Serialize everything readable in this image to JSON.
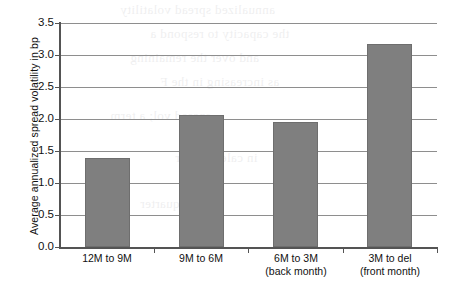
{
  "chart_data": {
    "type": "bar",
    "title": "",
    "xlabel": "",
    "ylabel": "Average annualized spread volatility in bp",
    "categories": [
      "12M to 9M",
      "9M to 6M",
      "6M to 3M\n(back month)",
      "3M to del\n(front month)"
    ],
    "category_lines": [
      [
        "12M to 9M",
        ""
      ],
      [
        "9M to 6M",
        ""
      ],
      [
        "6M to 3M",
        "(back month)"
      ],
      [
        "3M to del",
        "(front month)"
      ]
    ],
    "values": [
      1.39,
      2.06,
      1.96,
      3.17
    ],
    "ylim": [
      0.0,
      3.5
    ],
    "ytick_labels": [
      "3.5",
      "3.0",
      "2.5",
      "2.0",
      "1.5",
      "1.0",
      "0.5",
      "0.0"
    ],
    "ytick_values": [
      3.5,
      3.0,
      2.5,
      2.0,
      1.5,
      1.0,
      0.5,
      0.0
    ],
    "grid": true,
    "legend": "none",
    "bar_color": "#7f7f7f",
    "grid_color": "#8e8e8e",
    "axis_color": "#545454"
  },
  "ghost_text": {
    "lines": [
      "annualized spread volatility",
      "the capacity to respond a",
      "and over the remaining",
      "as increasing in the F",
      "spread vol; a term",
      "in calendar spr",
      "for the quarter"
    ]
  }
}
